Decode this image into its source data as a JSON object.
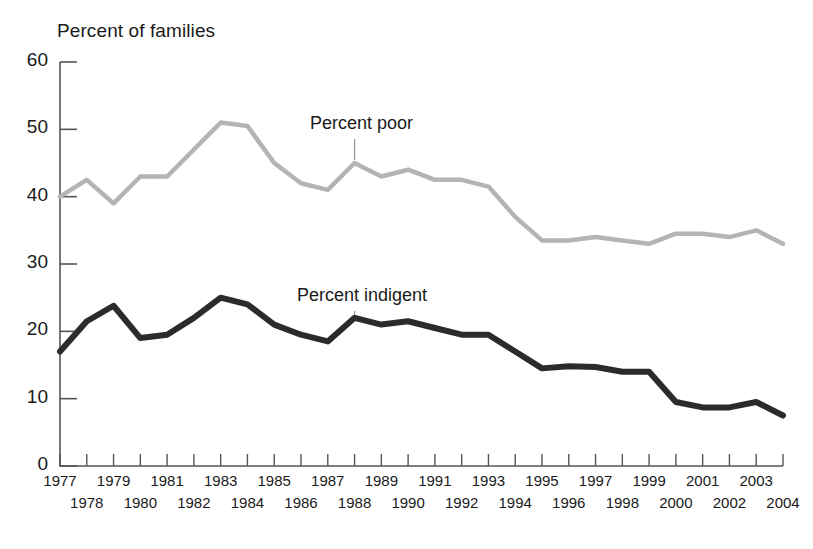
{
  "chart_data": {
    "type": "line",
    "title": "",
    "ylabel": "Percent of families",
    "xlabel": "",
    "ylim": [
      0,
      60
    ],
    "yticks": [
      0,
      10,
      20,
      30,
      40,
      50,
      60
    ],
    "grid": false,
    "legend_position": "inline-annotations",
    "x": [
      1977,
      1978,
      1979,
      1980,
      1981,
      1982,
      1983,
      1984,
      1985,
      1986,
      1987,
      1988,
      1989,
      1990,
      1991,
      1992,
      1993,
      1994,
      1995,
      1996,
      1997,
      1998,
      1999,
      2000,
      2001,
      2002,
      2003,
      2004
    ],
    "categories": [
      "1977",
      "1978",
      "1979",
      "1980",
      "1981",
      "1982",
      "1983",
      "1984",
      "1985",
      "1986",
      "1987",
      "1988",
      "1989",
      "1990",
      "1991",
      "1992",
      "1993",
      "1994",
      "1995",
      "1996",
      "1997",
      "1998",
      "1999",
      "2000",
      "2001",
      "2002",
      "2003",
      "2004"
    ],
    "series": [
      {
        "name": "Percent poor",
        "color": "#b4b4b4",
        "values": [
          40.0,
          42.5,
          39.0,
          43.0,
          43.0,
          47.0,
          51.0,
          50.5,
          45.0,
          42.0,
          41.0,
          45.0,
          43.0,
          44.0,
          42.5,
          42.5,
          41.5,
          37.0,
          33.5,
          33.5,
          34.0,
          33.5,
          33.0,
          34.5,
          34.5,
          34.0,
          35.0,
          33.0
        ]
      },
      {
        "name": "Percent indigent",
        "color": "#2b2b2b",
        "values": [
          17.0,
          21.5,
          23.8,
          19.0,
          19.5,
          22.0,
          25.0,
          24.0,
          21.0,
          19.5,
          18.5,
          22.0,
          21.0,
          21.5,
          20.5,
          19.5,
          19.5,
          17.0,
          14.5,
          14.8,
          14.7,
          14.0,
          14.0,
          9.5,
          8.7,
          8.7,
          9.5,
          7.5
        ]
      }
    ],
    "annotations": [
      {
        "text": "Percent poor",
        "series": "Percent poor",
        "anchor_year": 1988
      },
      {
        "text": "Percent indigent",
        "series": "Percent indigent",
        "anchor_year": 1988
      }
    ]
  },
  "axis": {
    "y_title": "Percent of families",
    "y_tick_labels": [
      "60",
      "50",
      "40",
      "30",
      "20",
      "10",
      "0"
    ],
    "x_tick_labels_top_row": [
      "1977",
      "1979",
      "1982",
      "1984",
      "1987",
      "1989",
      "1992",
      "1995",
      "1997",
      "1999",
      "2002",
      "2004"
    ],
    "x_tick_labels_bottom_row": [
      "1978",
      "1981",
      "1983",
      "1985",
      "1988",
      "1990",
      "1993",
      "1996",
      "1998",
      "2001",
      "2003"
    ]
  },
  "colors": {
    "poor_line": "#b4b4b4",
    "indigent_line": "#2b2b2b",
    "axis": "#555555",
    "text": "#1a1a1a"
  }
}
